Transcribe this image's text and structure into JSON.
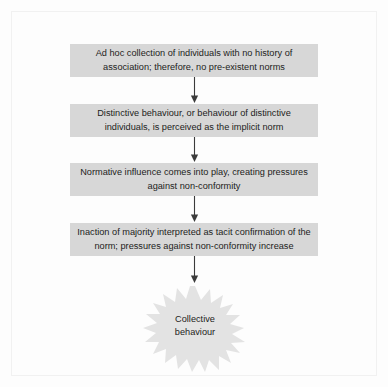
{
  "figure": {
    "type": "flowchart",
    "orientation": "vertical-top-to-bottom",
    "colors": {
      "box_fill": "#d7d7d7",
      "text": "#1d1d1b",
      "arrow": "#3b3b3b",
      "burst_fill": "#e3e3e3",
      "page_background": "#fdfdfd",
      "page_frame": "#f1f1f1"
    },
    "steps": [
      {
        "id": "step-1",
        "shape": "rectangle",
        "lines": [
          "Ad hoc collection of individuals with no history of",
          "association; therefore, no pre-existent norms"
        ]
      },
      {
        "id": "step-2",
        "shape": "rectangle",
        "lines": [
          "Distinctive behaviour, or behaviour of distinctive",
          "individuals, is perceived as the implicit norm"
        ]
      },
      {
        "id": "step-3",
        "shape": "rectangle",
        "lines": [
          "Normative influence comes into play, creating",
          "pressures against non-conformity"
        ]
      },
      {
        "id": "step-4",
        "shape": "rectangle",
        "lines": [
          "Inaction of majority interpreted as tacit confirmation of",
          "the norm; pressures against non-conformity increase"
        ]
      }
    ],
    "outcome": {
      "id": "outcome-burst",
      "shape": "starburst",
      "lines": [
        "Collective",
        "behaviour"
      ]
    },
    "connectors": [
      {
        "id": "connector-1",
        "from": "step-1",
        "to": "step-2",
        "style": "arrow-down"
      },
      {
        "id": "connector-2",
        "from": "step-2",
        "to": "step-3",
        "style": "arrow-down"
      },
      {
        "id": "connector-3",
        "from": "step-3",
        "to": "step-4",
        "style": "arrow-down"
      },
      {
        "id": "connector-4",
        "from": "step-4",
        "to": "outcome-burst",
        "style": "arrow-down"
      }
    ]
  }
}
